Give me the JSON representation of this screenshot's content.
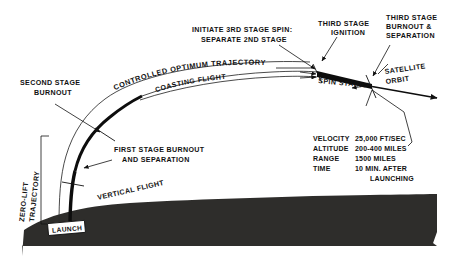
{
  "figure": {
    "kind": "technical-line-diagram",
    "background_color": "#ffffff",
    "ink_color": "#111111",
    "earth_color": "#2e2d2b"
  },
  "labels": {
    "second_stage_burnout": [
      "SECOND STAGE",
      "BURNOUT"
    ],
    "initiate_third_stage_spin": [
      "INITIATE 3RD STAGE SPIN:",
      "SEPARATE 2ND STAGE"
    ],
    "third_stage_ignition": [
      "THIRD STAGE",
      "IGNITION"
    ],
    "third_stage_burnout": [
      "THIRD STAGE",
      "BURNOUT &",
      "SEPARATION"
    ],
    "controlled_optimum_trajectory": "CONTROLLED OPTIMUM TRAJECTORY",
    "coasting_flight": "COASTING FLIGHT",
    "spin_stabilized": "SPIN STABILIZED",
    "satellite_orbit": [
      "SATELLITE",
      "ORBIT"
    ],
    "first_stage_burnout": [
      "FIRST STAGE BURNOUT",
      "AND SEPARATION"
    ],
    "vertical_flight": "VERTICAL FLIGHT",
    "zero_lift_trajectory": [
      "ZERO-LIFT",
      "TRAJECTORY"
    ],
    "launch": "LAUNCH"
  },
  "data_table": {
    "rows": [
      {
        "name": "VELOCITY",
        "value": "25,000 FT/SEC"
      },
      {
        "name": "ALTITUDE",
        "value": "200-400 MILES"
      },
      {
        "name": "RANGE",
        "value": "1500 MILES"
      },
      {
        "name": "TIME",
        "value": "10 MIN. AFTER"
      }
    ],
    "continuation": "LAUNCHING"
  }
}
